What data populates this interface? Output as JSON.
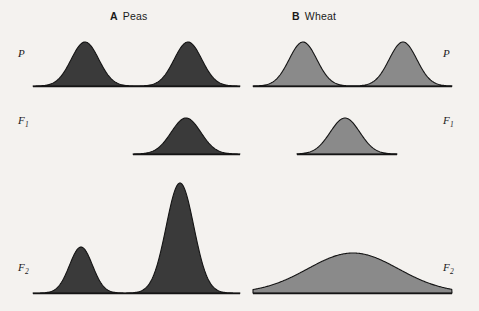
{
  "figure": {
    "background_color": "#f4f2ef",
    "line_color": "#141414"
  },
  "panels": [
    {
      "letter": "A",
      "name": "Peas",
      "fill_color": "#3a3a3a",
      "variation_type": "discontinuous"
    },
    {
      "letter": "B",
      "name": "Wheat",
      "fill_color": "#8a8a8a",
      "variation_type": "continuous"
    }
  ],
  "generation_labels": {
    "parental": "P",
    "f1_base": "F",
    "f1_sub": "1",
    "f2_base": "F",
    "f2_sub": "2"
  },
  "chart_data": {
    "type": "area",
    "xlabel": "",
    "ylabel": "",
    "grid": false,
    "legend": "none",
    "rows": [
      "P",
      "F1",
      "F2"
    ],
    "columns": [
      "A Peas",
      "B Wheat"
    ],
    "distributions": [
      {
        "panel": "A Peas",
        "generation": "P",
        "modality": "bimodal",
        "peaks": [
          {
            "center_x": 85,
            "height": 44,
            "width": 58
          },
          {
            "center_x": 188,
            "height": 44,
            "width": 58
          }
        ],
        "baseline_x": [
          33,
          240
        ],
        "baseline_y": 86
      },
      {
        "panel": "A Peas",
        "generation": "F1",
        "modality": "unimodal",
        "peaks": [
          {
            "center_x": 186,
            "height": 36,
            "width": 62
          }
        ],
        "baseline_x": [
          133,
          240
        ],
        "baseline_y": 154
      },
      {
        "panel": "A Peas",
        "generation": "F2",
        "modality": "bimodal",
        "peaks": [
          {
            "center_x": 81,
            "height": 46,
            "width": 48
          },
          {
            "center_x": 180,
            "height": 110,
            "width": 58
          }
        ],
        "baseline_x": [
          33,
          240
        ],
        "baseline_y": 293
      },
      {
        "panel": "B Wheat",
        "generation": "P",
        "modality": "bimodal",
        "peaks": [
          {
            "center_x": 303,
            "height": 44,
            "width": 58
          },
          {
            "center_x": 403,
            "height": 44,
            "width": 58
          }
        ],
        "baseline_x": [
          253,
          452
        ],
        "baseline_y": 86
      },
      {
        "panel": "B Wheat",
        "generation": "F1",
        "modality": "unimodal",
        "peaks": [
          {
            "center_x": 345,
            "height": 36,
            "width": 62
          }
        ],
        "baseline_x": [
          297,
          397
        ],
        "baseline_y": 154
      },
      {
        "panel": "B Wheat",
        "generation": "F2",
        "modality": "unimodal-broad",
        "peaks": [
          {
            "center_x": 353,
            "height": 40,
            "width": 190
          }
        ],
        "baseline_x": [
          253,
          452
        ],
        "baseline_y": 293
      }
    ]
  }
}
